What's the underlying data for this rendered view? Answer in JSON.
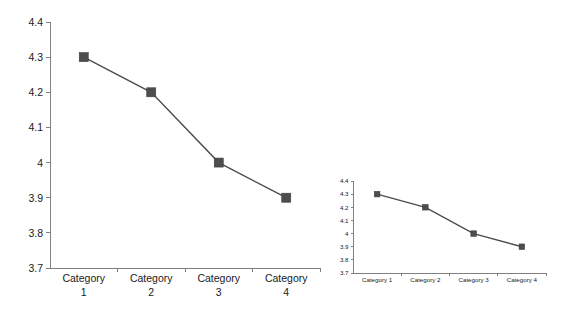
{
  "page": {
    "background_color": "#ffffff",
    "width": 582,
    "height": 311
  },
  "chart_data": [
    {
      "id": "main-chart",
      "type": "line",
      "title": "",
      "subtitle": "",
      "xlabel": "",
      "ylabel": "",
      "categories": [
        "Category 1",
        "Category 2",
        "Category 3",
        "Category 4"
      ],
      "category_lines": [
        [
          "Category",
          "1"
        ],
        [
          "Category",
          "2"
        ],
        [
          "Category",
          "3"
        ],
        [
          "Category",
          "4"
        ]
      ],
      "series": [
        {
          "name": "Series 1",
          "values": [
            4.3,
            4.2,
            4.0,
            3.9
          ],
          "line_color": "#4d4d4d",
          "marker_color": "#4d4d4d",
          "marker_shape": "square"
        }
      ],
      "ylim": [
        3.7,
        4.4
      ],
      "ytick_values": [
        4.4,
        4.3,
        4.2,
        4.1,
        4.0,
        3.9,
        3.8,
        3.7
      ],
      "ytick_labels": [
        "4.4",
        "4.3",
        "4.2",
        "4.1",
        "4",
        "3.9",
        "3.8",
        "3.7"
      ],
      "grid": false,
      "legend": "none",
      "axis_color": "#808080"
    },
    {
      "id": "small-chart",
      "type": "line",
      "title": "",
      "subtitle": "",
      "xlabel": "",
      "ylabel": "",
      "categories": [
        "Category 1",
        "Category 2",
        "Category 3",
        "Category 4"
      ],
      "category_lines": [
        [
          "Category 1"
        ],
        [
          "Category 2"
        ],
        [
          "Category 3"
        ],
        [
          "Category 4"
        ]
      ],
      "series": [
        {
          "name": "Series 1",
          "values": [
            4.3,
            4.2,
            4.0,
            3.9
          ],
          "line_color": "#4d4d4d",
          "marker_color": "#4d4d4d",
          "marker_shape": "square"
        }
      ],
      "ylim": [
        3.7,
        4.4
      ],
      "ytick_values": [
        4.4,
        4.3,
        4.2,
        4.1,
        4.0,
        3.9,
        3.8,
        3.7
      ],
      "ytick_labels": [
        "4.4",
        "4.3",
        "4.2",
        "4.1",
        "4",
        "3.9",
        "3.8",
        "3.7"
      ],
      "grid": false,
      "legend": "none",
      "axis_color": "#808080"
    }
  ]
}
